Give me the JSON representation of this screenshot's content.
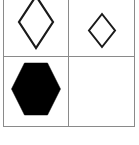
{
  "figure": {
    "name": "shape-grid-figure",
    "background_color": "#ffffff",
    "grid_line_color": "#8a8a8a",
    "shape_outline_color": "#1a1a1a",
    "shape_fill_color": "#000000",
    "rows": 2,
    "columns": 2
  },
  "cells": [
    {
      "position": "top-left",
      "shape": "diamond",
      "style": "outline",
      "size": "large",
      "outline_color": "#1a1a1a",
      "fill_color": "none",
      "stroke_width": 2.2,
      "width_px": 36,
      "height_px": 52,
      "clipped": "top",
      "icon_name": "diamond-outline-large-icon"
    },
    {
      "position": "top-right",
      "shape": "diamond",
      "style": "outline",
      "size": "small",
      "outline_color": "#1a1a1a",
      "fill_color": "none",
      "stroke_width": 2.0,
      "width_px": 26,
      "height_px": 33,
      "clipped": "none",
      "icon_name": "diamond-outline-small-icon"
    },
    {
      "position": "bottom-left",
      "shape": "hexagon",
      "style": "filled",
      "size": "large",
      "outline_color": "#000000",
      "fill_color": "#000000",
      "stroke_width": 0,
      "width_px": 49,
      "height_px": 52,
      "orientation": "flat-top",
      "clipped": "none",
      "icon_name": "hexagon-filled-icon"
    },
    {
      "position": "bottom-right",
      "shape": "none",
      "style": "empty",
      "size": "",
      "outline_color": "none",
      "fill_color": "none",
      "stroke_width": 0,
      "width_px": 0,
      "height_px": 0,
      "clipped": "none",
      "icon_name": "empty-cell"
    }
  ]
}
